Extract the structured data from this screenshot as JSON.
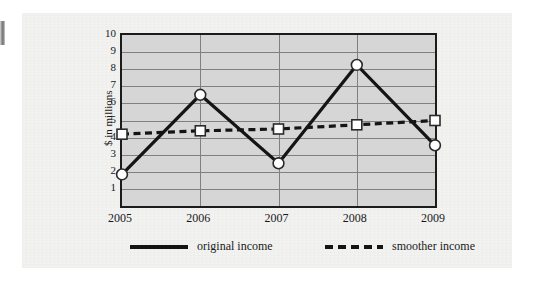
{
  "chart_data": {
    "type": "line",
    "title": "",
    "xlabel": "",
    "ylabel": "$ in millions",
    "categories": [
      "2005",
      "2006",
      "2007",
      "2008",
      "2009"
    ],
    "x": [
      2005,
      2006,
      2007,
      2008,
      2009
    ],
    "ylim": [
      0,
      10
    ],
    "xtick_labels": [
      "2005",
      "2006",
      "2007",
      "2008",
      "2009"
    ],
    "ytick_labels": [
      "1",
      "2",
      "3",
      "4",
      "5",
      "6",
      "7",
      "8",
      "9",
      "10"
    ],
    "ytick_values": [
      1,
      2,
      3,
      4,
      5,
      6,
      7,
      8,
      9,
      10
    ],
    "grid": "horizontal-and-vertical",
    "legend_position": "bottom",
    "plot_background": "#d6d6d6",
    "series": [
      {
        "name": "original income",
        "style": "solid",
        "marker": "circle",
        "color": "#141414",
        "marker_fill": "#ffffff",
        "values": [
          1.85,
          6.5,
          2.5,
          8.25,
          3.55
        ]
      },
      {
        "name": "smoother income",
        "style": "dashed",
        "marker": "square",
        "color": "#141414",
        "marker_fill": "#ffffff",
        "values": [
          4.2,
          4.4,
          4.5,
          4.75,
          5.0
        ]
      }
    ]
  },
  "legend": {
    "items": [
      {
        "label": "original income",
        "style": "solid"
      },
      {
        "label": "smoother income",
        "style": "dashed"
      }
    ]
  },
  "colors": {
    "page_background": "#ffffff",
    "panel_background": "#f2f2f1",
    "plot_background": "#d6d6d6",
    "axis": "#1c1c1c",
    "grid": "#808080",
    "line": "#141414",
    "marker_fill": "#ffffff"
  }
}
